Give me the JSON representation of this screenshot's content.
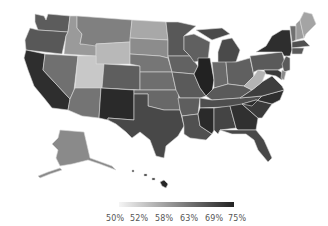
{
  "chart_data": {
    "type": "choropleth",
    "title": "",
    "region": "United States",
    "legend": {
      "position": "bottom-center",
      "gradient": [
        "#f5f5f5",
        "#222222"
      ],
      "tick_labels": [
        "50%",
        "52%",
        "58%",
        "63%",
        "69%",
        "75%"
      ]
    },
    "states": [
      {
        "name": "Washington",
        "shade": "#5c5c5c"
      },
      {
        "name": "Oregon",
        "shade": "#585858"
      },
      {
        "name": "California",
        "shade": "#2e2e2e"
      },
      {
        "name": "Idaho",
        "shade": "#9a9a9a"
      },
      {
        "name": "Nevada",
        "shade": "#707070"
      },
      {
        "name": "Montana",
        "shade": "#808080"
      },
      {
        "name": "Wyoming",
        "shade": "#b8b8b8"
      },
      {
        "name": "Utah",
        "shade": "#c8c8c8"
      },
      {
        "name": "Arizona",
        "shade": "#747474"
      },
      {
        "name": "Colorado",
        "shade": "#5e5e5e"
      },
      {
        "name": "New Mexico",
        "shade": "#2a2a2a"
      },
      {
        "name": "North Dakota",
        "shade": "#a8a8a8"
      },
      {
        "name": "South Dakota",
        "shade": "#8c8c8c"
      },
      {
        "name": "Nebraska",
        "shade": "#767676"
      },
      {
        "name": "Kansas",
        "shade": "#6e6e6e"
      },
      {
        "name": "Oklahoma",
        "shade": "#686868"
      },
      {
        "name": "Texas",
        "shade": "#484848"
      },
      {
        "name": "Minnesota",
        "shade": "#585858"
      },
      {
        "name": "Iowa",
        "shade": "#626262"
      },
      {
        "name": "Missouri",
        "shade": "#5a5a5a"
      },
      {
        "name": "Arkansas",
        "shade": "#5e5e5e"
      },
      {
        "name": "Louisiana",
        "shade": "#505050"
      },
      {
        "name": "Wisconsin",
        "shade": "#606060"
      },
      {
        "name": "Illinois",
        "shade": "#222222"
      },
      {
        "name": "Michigan",
        "shade": "#4a4a4a"
      },
      {
        "name": "Indiana",
        "shade": "#6a6a6a"
      },
      {
        "name": "Ohio",
        "shade": "#606060"
      },
      {
        "name": "Kentucky",
        "shade": "#5a5a5a"
      },
      {
        "name": "Tennessee",
        "shade": "#4e4e4e"
      },
      {
        "name": "Mississippi",
        "shade": "#2a2a2a"
      },
      {
        "name": "Alabama",
        "shade": "#444444"
      },
      {
        "name": "Georgia",
        "shade": "#303030"
      },
      {
        "name": "Florida",
        "shade": "#484848"
      },
      {
        "name": "South Carolina",
        "shade": "#3a3a3a"
      },
      {
        "name": "North Carolina",
        "shade": "#2e2e2e"
      },
      {
        "name": "Virginia",
        "shade": "#3e3e3e"
      },
      {
        "name": "West Virginia",
        "shade": "#b4b4b4"
      },
      {
        "name": "Pennsylvania",
        "shade": "#5a5a5a"
      },
      {
        "name": "New York",
        "shade": "#2e2e2e"
      },
      {
        "name": "Vermont",
        "shade": "#707070"
      },
      {
        "name": "New Hampshire",
        "shade": "#9c9c9c"
      },
      {
        "name": "Maine",
        "shade": "#a4a4a4"
      },
      {
        "name": "Massachusetts",
        "shade": "#505050"
      },
      {
        "name": "Connecticut",
        "shade": "#5a5a5a"
      },
      {
        "name": "New Jersey",
        "shade": "#5a5a5a"
      },
      {
        "name": "Maryland",
        "shade": "#3a3a3a"
      },
      {
        "name": "Delaware",
        "shade": "#8a8a8a"
      },
      {
        "name": "Alaska",
        "shade": "#8a8a8a"
      },
      {
        "name": "Hawaii",
        "shade": "#262626"
      }
    ]
  }
}
